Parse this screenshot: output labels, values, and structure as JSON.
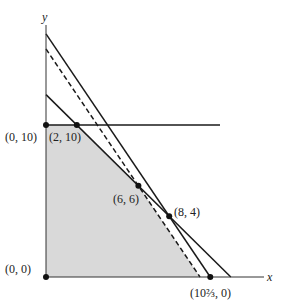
{
  "chart_data": {
    "type": "diagram",
    "title": "",
    "xlabel": "x",
    "ylabel": "y",
    "frame": {
      "origin_px": [
        46,
        277
      ],
      "scale_px_per_unit": [
        15.4,
        15.2
      ],
      "x_axis_end_px": 264,
      "y_axis_top_px": 25
    },
    "colors": {
      "line": "#1a1a1a",
      "axis": "#333333",
      "shade": "#d9d9d9",
      "point": "#111111"
    },
    "feasible_region": {
      "vertices": [
        [
          0,
          0
        ],
        [
          0,
          10
        ],
        [
          2,
          10
        ],
        [
          6,
          6
        ],
        [
          10,
          0
        ]
      ]
    },
    "lines": [
      {
        "name": "constraint-y-10",
        "equation": "y = 10",
        "from": [
          0,
          10
        ],
        "to": [
          11.3,
          10
        ],
        "style": "solid"
      },
      {
        "name": "constraint-x-plus-y-12",
        "equation": "x + y = 12",
        "from": [
          0,
          12
        ],
        "to": [
          12,
          0
        ],
        "style": "solid"
      },
      {
        "name": "constraint-3x-plus-2y-32",
        "equation": "3x + 2y = 32",
        "from": [
          0,
          16
        ],
        "to": [
          10.667,
          0
        ],
        "style": "solid"
      },
      {
        "name": "objective-3x-plus-2y-30",
        "equation": "3x + 2y = 30",
        "from": [
          0,
          15
        ],
        "to": [
          10,
          0
        ],
        "style": "dashed"
      }
    ],
    "points": [
      {
        "x": 0,
        "y": 0,
        "label": "(0, 0)",
        "label_px": [
          5,
          273
        ]
      },
      {
        "x": 0,
        "y": 10,
        "label": "(0, 10)",
        "label_px": [
          5,
          141
        ]
      },
      {
        "x": 2,
        "y": 10,
        "label": "(2, 10)",
        "label_px": [
          49,
          141
        ]
      },
      {
        "x": 6,
        "y": 6,
        "label": "(6, 6)",
        "label_px": [
          113,
          203
        ]
      },
      {
        "x": 8,
        "y": 4,
        "label": "(8, 4)",
        "label_px": [
          174,
          216
        ]
      },
      {
        "x": 10.667,
        "y": 0,
        "label": "(10⅔, 0)",
        "label_px": [
          190,
          297
        ]
      }
    ],
    "axis_labels": {
      "x": {
        "text": "x",
        "px": [
          267,
          281
        ]
      },
      "y": {
        "text": "y",
        "px": [
          42,
          21
        ]
      }
    }
  }
}
